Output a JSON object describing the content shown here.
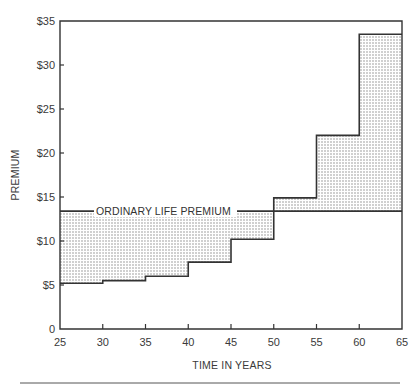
{
  "chart_data": {
    "type": "area",
    "title": "",
    "xlabel": "TIME IN YEARS",
    "ylabel": "PREMIUM",
    "xlim": [
      25,
      65
    ],
    "ylim": [
      0,
      35
    ],
    "x_ticks": [
      25,
      30,
      35,
      40,
      45,
      50,
      55,
      60,
      65
    ],
    "y_ticks": [
      0,
      5,
      10,
      15,
      20,
      25,
      30,
      35
    ],
    "y_tick_labels": [
      "0",
      "$5",
      "$10",
      "$15",
      "$20",
      "$25",
      "$30",
      "$35"
    ],
    "x_tick_labels": [
      "25",
      "30",
      "35",
      "40",
      "45",
      "50",
      "55",
      "60",
      "65"
    ],
    "grid": false,
    "series": [
      {
        "name": "Ordinary Life Premium",
        "style": "flat line",
        "x": [
          25,
          65
        ],
        "values": [
          13.4,
          13.4
        ]
      },
      {
        "name": "Term Premium (5-year renewable steps)",
        "style": "step",
        "x_starts": [
          25,
          30,
          35,
          40,
          45,
          50,
          55,
          60
        ],
        "x_ends": [
          30,
          35,
          40,
          45,
          50,
          55,
          60,
          65
        ],
        "values": [
          5.2,
          5.5,
          6.0,
          7.6,
          10.2,
          14.9,
          22.0,
          33.5
        ]
      }
    ],
    "shading": "dotted area between ordinary life premium line and term step premium",
    "annotations": [
      {
        "text": "ORDINARY LIFE PREMIUM",
        "x": 27,
        "y": 13.4
      }
    ]
  },
  "labels": {
    "ylabel": "PREMIUM",
    "xlabel": "TIME IN YEARS",
    "annotation": "ORDINARY LIFE PREMIUM"
  },
  "colors": {
    "line": "#333333",
    "dots": "#8a8a8a",
    "background": "#ffffff"
  }
}
